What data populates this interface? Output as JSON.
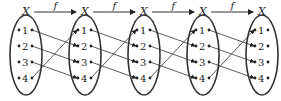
{
  "diagram": {
    "set_label": "X",
    "function_label": "f",
    "elements": [
      "1",
      "2",
      "3",
      "4"
    ],
    "mapping": {
      "1": "2",
      "2": "3",
      "3": "4",
      "4": "1"
    },
    "num_sets": 5
  }
}
